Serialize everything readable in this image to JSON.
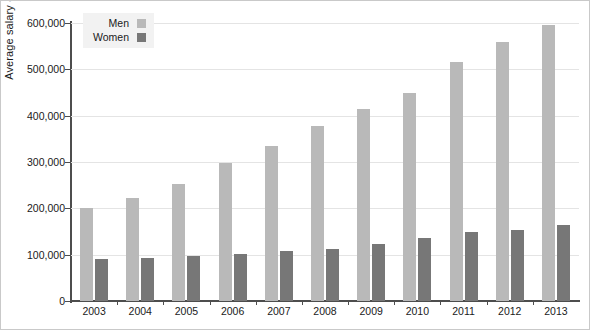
{
  "chart_data": {
    "type": "bar",
    "title": "",
    "xlabel": "",
    "ylabel": "Average salary ($)",
    "categories": [
      "2003",
      "2004",
      "2005",
      "2006",
      "2007",
      "2008",
      "2009",
      "2010",
      "2011",
      "2012",
      "2013"
    ],
    "series": [
      {
        "name": "Men",
        "color": "#b9b9b9",
        "values": [
          200000,
          223000,
          252000,
          297000,
          335000,
          378000,
          415000,
          450000,
          516000,
          560000,
          595000
        ]
      },
      {
        "name": "Women",
        "color": "#777777",
        "values": [
          90000,
          92000,
          97000,
          101000,
          107000,
          113000,
          122000,
          137000,
          148000,
          153000,
          163000
        ]
      }
    ],
    "ylim": [
      0,
      600000
    ],
    "ytick_values": [
      0,
      100000,
      200000,
      300000,
      400000,
      500000,
      600000
    ],
    "ytick_labels": [
      "0",
      "100,000",
      "200,000",
      "300,000",
      "400,000",
      "500,000",
      "600,000"
    ],
    "grid": true,
    "grid_axis": "y",
    "legend_position": "top-left"
  }
}
